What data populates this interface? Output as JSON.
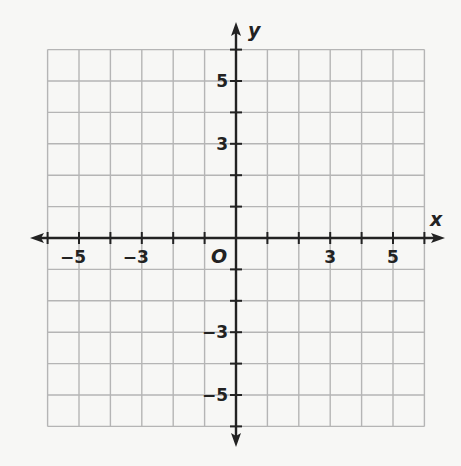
{
  "chart_data": {
    "type": "coordinate-grid",
    "title": "",
    "xlabel": "x",
    "ylabel": "y",
    "origin_label": "O",
    "xlim": [
      -6,
      6
    ],
    "ylim": [
      -6,
      6
    ],
    "grid": true,
    "x_tick_labels": [
      {
        "value": -5,
        "text": "−5"
      },
      {
        "value": -3,
        "text": "−3"
      },
      {
        "value": 3,
        "text": "3"
      },
      {
        "value": 5,
        "text": "5"
      }
    ],
    "y_tick_labels": [
      {
        "value": 5,
        "text": "5"
      },
      {
        "value": 3,
        "text": "3"
      },
      {
        "value": -3,
        "text": "−3"
      },
      {
        "value": -5,
        "text": "−5"
      }
    ]
  },
  "colors": {
    "grid": "#b5b5b5",
    "axis": "#222222",
    "background": "#f7f7f5"
  }
}
